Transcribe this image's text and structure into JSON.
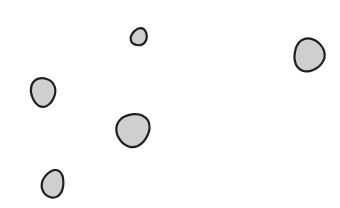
{
  "canvas": {
    "width": 340,
    "height": 208,
    "background": "#ffffff"
  },
  "style": {
    "fill": "#cfcfcf",
    "stroke": "#1f1f1f",
    "stroke_width": 2.2
  },
  "blobs": [
    {
      "name": "blob-small-top",
      "cx": 139,
      "cy": 37,
      "rx": 7.5,
      "ry": 9,
      "rotate": 25
    },
    {
      "name": "blob-right",
      "cx": 309,
      "cy": 55,
      "rx": 15.5,
      "ry": 16,
      "rotate": 10
    },
    {
      "name": "blob-left",
      "cx": 43,
      "cy": 92,
      "rx": 12,
      "ry": 14.5,
      "rotate": 5
    },
    {
      "name": "blob-middle",
      "cx": 133,
      "cy": 130,
      "rx": 16,
      "ry": 17,
      "rotate": 20
    },
    {
      "name": "blob-bottom",
      "cx": 53,
      "cy": 184,
      "rx": 11,
      "ry": 13.5,
      "rotate": 15
    }
  ]
}
